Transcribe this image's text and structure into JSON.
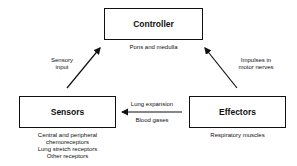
{
  "diagram": {
    "nodes": {
      "controller": {
        "label": "Controller",
        "caption": "Pons and medulla"
      },
      "sensors": {
        "label": "Sensors",
        "caption_lines": [
          "Central and peripheral",
          "chemoreceptors",
          "Lung stretch receptors",
          "Other receptors"
        ]
      },
      "effectors": {
        "label": "Effectors",
        "caption": "Respiratory muscles"
      }
    },
    "edges": {
      "sensors_to_controller": {
        "label_lines": [
          "Sensory",
          "input"
        ]
      },
      "effectors_to_controller": {
        "label_lines": [
          "Impulses in",
          "motor nerves"
        ]
      },
      "effectors_to_sensors": {
        "label_top": "Lung expansion",
        "label_bottom": "Blood gases"
      }
    }
  }
}
